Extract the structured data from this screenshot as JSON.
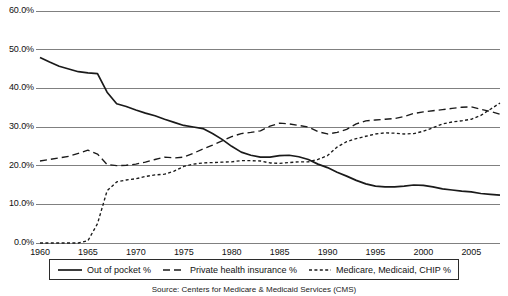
{
  "chart_data": {
    "type": "line",
    "title": "",
    "subtitle": "",
    "xlabel": "",
    "ylabel": "",
    "xlim": [
      1960,
      2008
    ],
    "ylim": [
      0,
      60
    ],
    "grid": "horizontal",
    "legend_position": "bottom",
    "y_ticks": [
      "0.0%",
      "10.0%",
      "20.0%",
      "30.0%",
      "40.0%",
      "50.0%",
      "60.0%"
    ],
    "y_tick_values": [
      0,
      10,
      20,
      30,
      40,
      50,
      60
    ],
    "x_ticks": [
      "1960",
      "1965",
      "1970",
      "1975",
      "1980",
      "1985",
      "1990",
      "1995",
      "2000",
      "2005"
    ],
    "x_tick_values": [
      1960,
      1965,
      1970,
      1975,
      1980,
      1985,
      1990,
      1995,
      2000,
      2005
    ],
    "x": [
      1960,
      1961,
      1962,
      1963,
      1964,
      1965,
      1966,
      1967,
      1968,
      1969,
      1970,
      1971,
      1972,
      1973,
      1974,
      1975,
      1976,
      1977,
      1978,
      1979,
      1980,
      1981,
      1982,
      1983,
      1984,
      1985,
      1986,
      1987,
      1988,
      1989,
      1990,
      1991,
      1992,
      1993,
      1994,
      1995,
      1996,
      1997,
      1998,
      1999,
      2000,
      2001,
      2002,
      2003,
      2004,
      2005,
      2006,
      2007,
      2008
    ],
    "series": [
      {
        "name": "Out of pocket %",
        "style": "solid",
        "color": "#1a1a1a",
        "values": [
          48.0,
          46.8,
          45.7,
          45.0,
          44.3,
          44.0,
          43.8,
          39.0,
          36.0,
          35.3,
          34.4,
          33.6,
          32.9,
          32.0,
          31.2,
          30.4,
          30.0,
          29.6,
          28.3,
          26.8,
          25.0,
          23.5,
          22.7,
          22.2,
          22.2,
          22.6,
          22.7,
          22.3,
          21.6,
          20.4,
          19.5,
          18.3,
          17.3,
          16.2,
          15.3,
          14.7,
          14.5,
          14.5,
          14.7,
          15.0,
          14.9,
          14.5,
          14.0,
          13.7,
          13.4,
          13.2,
          12.8,
          12.6,
          12.4
        ]
      },
      {
        "name": "Private health insurance %",
        "style": "dashed",
        "color": "#1a1a1a",
        "values": [
          21.2,
          21.6,
          22.0,
          22.4,
          23.2,
          24.0,
          23.0,
          20.3,
          20.0,
          20.1,
          20.4,
          20.9,
          21.6,
          22.2,
          22.0,
          22.2,
          23.2,
          24.3,
          25.3,
          26.4,
          27.5,
          28.3,
          28.6,
          29.0,
          30.2,
          31.0,
          30.8,
          30.4,
          30.0,
          28.8,
          28.2,
          28.6,
          29.4,
          30.8,
          31.6,
          31.8,
          32.0,
          32.2,
          32.7,
          33.5,
          33.9,
          34.2,
          34.5,
          34.8,
          35.1,
          35.2,
          34.6,
          34.0,
          33.3
        ]
      },
      {
        "name": "Medicare, Medicaid, CHIP %",
        "style": "dotted",
        "color": "#1a1a1a",
        "values": [
          0.0,
          0.0,
          0.0,
          0.0,
          0.0,
          0.6,
          5.0,
          13.5,
          15.8,
          16.3,
          16.6,
          17.2,
          17.6,
          17.8,
          18.6,
          19.8,
          20.4,
          20.7,
          20.8,
          20.9,
          21.0,
          21.3,
          21.3,
          21.2,
          20.7,
          20.6,
          20.8,
          21.0,
          21.0,
          21.6,
          22.6,
          24.8,
          26.2,
          27.0,
          27.6,
          28.2,
          28.5,
          28.4,
          28.2,
          28.3,
          28.9,
          29.8,
          30.8,
          31.3,
          31.6,
          32.0,
          33.0,
          34.6,
          36.2
        ]
      }
    ]
  },
  "legend": {
    "items": [
      {
        "label": "Out of pocket %",
        "style": "solid"
      },
      {
        "label": "Private health insurance %",
        "style": "dashed"
      },
      {
        "label": "Medicare, Medicaid, CHIP %",
        "style": "dotted"
      }
    ]
  },
  "source": {
    "caption": "Source: Centers for Medicare & Medicaid Services (CMS)"
  }
}
